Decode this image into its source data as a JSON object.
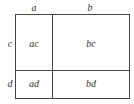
{
  "diagram": {
    "top_labels": [
      "a",
      "b"
    ],
    "side_labels": [
      "c",
      "d"
    ],
    "cells": [
      "ac",
      "bc",
      "ad",
      "bd"
    ],
    "line_color": "#444444"
  }
}
